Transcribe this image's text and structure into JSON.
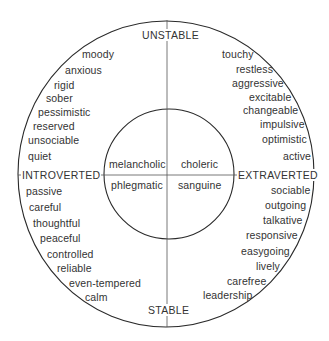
{
  "diagram": {
    "axes": {
      "top": "UNSTABLE",
      "bottom": "STABLE",
      "left": "INTROVERTED",
      "right": "EXTRAVERTED"
    },
    "temperaments": {
      "top_left": "melancholic",
      "top_right": "choleric",
      "bottom_left": "phlegmatic",
      "bottom_right": "sanguine"
    },
    "traits": {
      "unstable_introverted": [
        "moody",
        "anxious",
        "rigid",
        "sober",
        "pessimistic",
        "reserved",
        "unsociable",
        "quiet"
      ],
      "unstable_extraverted": [
        "touchy",
        "restless",
        "aggressive",
        "excitable",
        "changeable",
        "impulsive",
        "optimistic",
        "active"
      ],
      "stable_introverted": [
        "passive",
        "careful",
        "thoughtful",
        "peaceful",
        "controlled",
        "reliable",
        "even-tempered",
        "calm"
      ],
      "stable_extraverted": [
        "sociable",
        "outgoing",
        "talkative",
        "responsive",
        "easygoing",
        "lively",
        "carefree",
        "leadership"
      ]
    },
    "colors": {
      "line": "#2a2a2a",
      "text": "#333333",
      "background": "#ffffff"
    }
  }
}
